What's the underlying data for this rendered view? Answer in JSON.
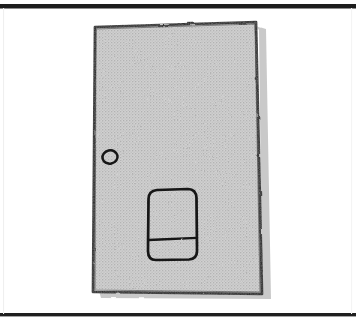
{
  "document": {
    "kind": "hand-drawn-sketch",
    "title": "Hand-drawn sketch of a door panel",
    "width": 356,
    "height": 323
  },
  "colors": {
    "page_background": "#ffffff",
    "frame_line": "#1b1b1b",
    "frame_line_light": "#f2f2f2",
    "panel_fill": "#c9c9c9",
    "panel_fill_light": "#d4d4d4",
    "panel_stroke": "#1a1a1a",
    "shadow": "#9a9a9a",
    "halftone_dot": "#b5b5b5"
  },
  "frame": {
    "name": "page-frame",
    "top_rule_y": 6,
    "bottom_rule_y": 315,
    "left_rule_x": 3,
    "right_rule_x": 352,
    "top_rule_thickness": 4,
    "bottom_rule_thickness": 3,
    "side_rule_thickness": 1
  },
  "shapes": {
    "door_panel": {
      "name": "door-panel",
      "label": "door panel",
      "points": "95,27 256,22 262,294 93,292",
      "fill": "#cbcbcb",
      "stroke": "#1a1a1a",
      "stroke_width": 2.6
    },
    "door_shadow": {
      "name": "door-shadow",
      "points": "259,27 266,27 271,298 98,297 97,292 263,293",
      "fill": "#a6a6a6"
    },
    "knob": {
      "name": "door-knob",
      "label": "knob",
      "cx": 110,
      "cy": 157,
      "rx": 7.5,
      "ry": 6.5,
      "rotation": -12,
      "stroke": "#141414",
      "stroke_width": 2.4,
      "fill": "none"
    },
    "pocket": {
      "name": "door-pocket",
      "label": "pocket panel",
      "x": 148,
      "y": 190,
      "width": 49,
      "height": 70,
      "corner_radius": 9,
      "stroke": "#141414",
      "stroke_width": 2.6,
      "fill": "none"
    },
    "pocket_divider": {
      "name": "pocket-divider-line",
      "x1": 149,
      "y1": 240,
      "x2": 197,
      "y2": 238,
      "stroke": "#141414",
      "stroke_width": 2.2
    }
  },
  "accessibility": {
    "alt_text": "A hand-drawn pencil sketch showing a tall, slightly tilted rectangular door panel filled with light gray shading. A small circular knob sits near the left edge at mid height, and a rounded rectangular pocket divided by a horizontal line sits in the lower right area of the panel."
  }
}
